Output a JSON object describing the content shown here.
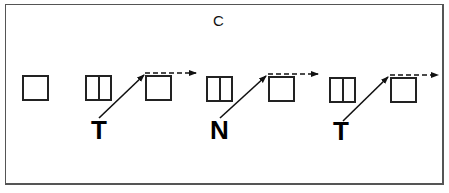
{
  "panel": {
    "label": "C"
  },
  "sequence": [
    {
      "type": "empty-box"
    },
    {
      "type": "split-box",
      "letter": "T"
    },
    {
      "type": "empty-box",
      "arrow_in": "solid-from-letter",
      "arrow_out": "dashed-right"
    },
    {
      "type": "split-box",
      "letter": "N"
    },
    {
      "type": "empty-box",
      "arrow_in": "solid-from-letter",
      "arrow_out": "dashed-right"
    },
    {
      "type": "split-box",
      "letter": "T"
    },
    {
      "type": "empty-box",
      "arrow_in": "solid-from-letter",
      "arrow_out": "dashed-right"
    }
  ],
  "letters": {
    "first": "T",
    "second": "N",
    "third": "T"
  },
  "colors": {
    "stroke": "#222222",
    "frame": "#555555",
    "background": "#ffffff"
  }
}
